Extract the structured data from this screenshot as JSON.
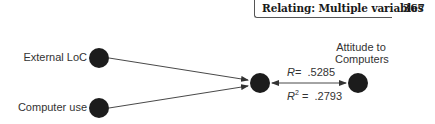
{
  "header": {
    "title": "Relating: Multiple variables",
    "page_number": "367"
  },
  "diagram": {
    "nodes": [
      {
        "id": "external-loc",
        "label": "External LoC",
        "cx": 99,
        "cy": 58,
        "r": 10
      },
      {
        "id": "computer-use",
        "label": "Computer use",
        "cx": 99,
        "cy": 108,
        "r": 10
      },
      {
        "id": "combined",
        "label": "",
        "cx": 260,
        "cy": 83,
        "r": 10
      },
      {
        "id": "attitude",
        "label": "Attitude to Computers",
        "cx": 358,
        "cy": 83,
        "r": 10
      }
    ],
    "labels": {
      "external_loc": "External LoC",
      "computer_use": "Computer use",
      "attitude_line1": "Attitude to",
      "attitude_line2": "Computers"
    },
    "stats": {
      "r_symbol": "R",
      "r_equals": "=",
      "r_value": ".5285",
      "r2_symbol": "R",
      "r2_exp": "2",
      "r2_equals": "=",
      "r2_value": ".2793"
    },
    "colors": {
      "node": "#1c1c1c",
      "line": "#333333"
    }
  }
}
